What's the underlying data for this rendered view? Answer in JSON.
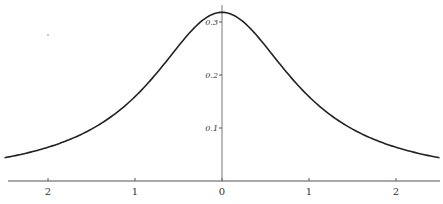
{
  "chart_data": {
    "type": "line",
    "title": "",
    "xlabel": "",
    "ylabel": "",
    "xlim": [
      -2.5,
      2.5
    ],
    "ylim": [
      0,
      0.33
    ],
    "grid": false,
    "legend": null,
    "x_ticks": [
      -2,
      -1,
      0,
      1,
      2
    ],
    "x_tick_labels": [
      "2",
      "1",
      "0",
      "1",
      "2"
    ],
    "y_ticks": [
      0.1,
      0.2,
      0.3
    ],
    "y_tick_labels": [
      "0.1",
      "0.2",
      "0.3"
    ],
    "series": [
      {
        "name": "density",
        "x": [
          -2.5,
          -2.25,
          -2.0,
          -1.75,
          -1.5,
          -1.25,
          -1.0,
          -0.75,
          -0.5,
          -0.25,
          0.0,
          0.25,
          0.5,
          0.75,
          1.0,
          1.25,
          1.5,
          1.75,
          2.0,
          2.25,
          2.5
        ],
        "y": [
          0.044,
          0.052,
          0.064,
          0.078,
          0.098,
          0.124,
          0.159,
          0.204,
          0.255,
          0.3,
          0.318,
          0.3,
          0.255,
          0.204,
          0.159,
          0.124,
          0.098,
          0.078,
          0.064,
          0.052,
          0.044
        ]
      }
    ]
  },
  "axes": {
    "y_labels": [
      "0.3",
      "0.2",
      "0.1"
    ],
    "x_labels": [
      "2",
      "1",
      "0",
      "1",
      "2"
    ]
  }
}
